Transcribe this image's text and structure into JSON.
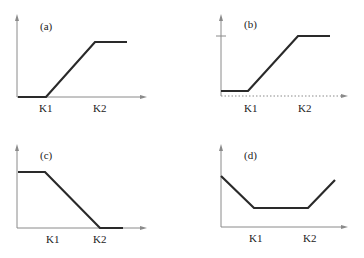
{
  "panels": [
    {
      "id": "a",
      "label": "(a)",
      "k1": "K1",
      "k2": "K2",
      "shape": "flat-low, rise K1→K2, flat-high"
    },
    {
      "id": "b",
      "label": "(b)",
      "k1": "K1",
      "k2": "K2",
      "shape": "flat-low (above dotted axis), rise K1→K2, flat-high at tick"
    },
    {
      "id": "c",
      "label": "(c)",
      "k1": "K1",
      "k2": "K2",
      "shape": "flat-high, fall K1→K2, flat-low"
    },
    {
      "id": "d",
      "label": "(d)",
      "k1": "K1",
      "k2": "K2",
      "shape": "fall to K1, flat K1→K2, rise after K2"
    }
  ],
  "colors": {
    "axis": "#8a8a8a",
    "curve": "#2a2a2a"
  }
}
